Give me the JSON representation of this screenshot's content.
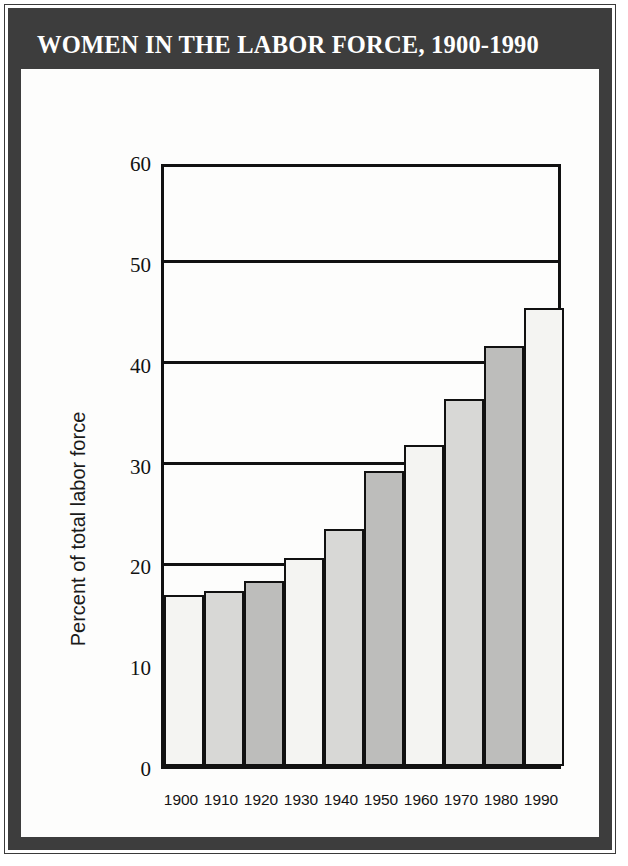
{
  "poster": {
    "title": "WOMEN IN THE LABOR FORCE, 1900-1990",
    "frame_color": "#3d3d3d",
    "banner_text_color": "#ffffff",
    "background_color": "#fdfdfc"
  },
  "chart_data": {
    "type": "bar",
    "title": "WOMEN IN THE LABOR FORCE, 1900-1990",
    "xlabel": "",
    "ylabel": "Percent of total labor force",
    "categories": [
      "1900",
      "1910",
      "1920",
      "1930",
      "1940",
      "1950",
      "1960",
      "1970",
      "1980",
      "1990"
    ],
    "values": [
      17.0,
      17.4,
      18.3,
      20.6,
      23.5,
      29.3,
      31.8,
      36.4,
      41.7,
      45.4
    ],
    "ylim": [
      0,
      60
    ],
    "yticks": [
      0,
      10,
      20,
      30,
      40,
      50,
      60
    ],
    "ytick_labels": [
      "0",
      "10",
      "20",
      "30",
      "40",
      "50",
      "60"
    ],
    "gridlines_at": [
      20,
      30,
      40,
      50
    ],
    "grid": true,
    "legend": "none",
    "bar_fill_colors": [
      "#f4f4f2",
      "#d8d8d6",
      "#bdbdbb",
      "#f4f4f2",
      "#d8d8d6",
      "#bdbdbb",
      "#f4f4f2",
      "#d8d8d6",
      "#bdbdbb",
      "#f4f4f2"
    ],
    "bar_edge_color": "#111111",
    "axis_color": "#111111"
  }
}
